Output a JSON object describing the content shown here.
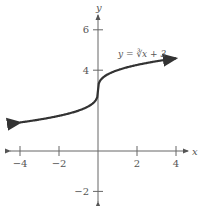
{
  "chart_data": {
    "type": "line",
    "title": "",
    "xlabel": "x",
    "ylabel": "y",
    "xlim": [
      -4.5,
      4.5
    ],
    "ylim": [
      -2.5,
      6.5
    ],
    "grid": false,
    "x_ticks": [
      -4,
      -2,
      2,
      4
    ],
    "x_tick_labels": [
      "−4",
      "−2",
      "2",
      "4"
    ],
    "y_ticks": [
      -2,
      4,
      6
    ],
    "y_tick_labels": [
      "−2",
      "4",
      "6"
    ],
    "series": [
      {
        "name": "y = ∛x + 3",
        "function": "cbrt(x) + 3",
        "x_range": [
          -4,
          4
        ],
        "x": [
          -4,
          -3,
          -2,
          -1,
          -0.5,
          -0.1,
          0,
          0.1,
          0.5,
          1,
          2,
          3,
          4
        ],
        "y": [
          1.41,
          1.56,
          1.74,
          2,
          2.21,
          2.54,
          3,
          3.46,
          3.79,
          4,
          4.26,
          4.44,
          4.59
        ],
        "color": "#333333",
        "arrows_both_ends": true
      }
    ],
    "annotations": [
      {
        "text": "y = ∛x + 3",
        "x": 2.3,
        "y": 5.0
      }
    ]
  },
  "labels": {
    "x_axis": "x",
    "y_axis": "y",
    "equation": "y = ∛x + 3"
  }
}
